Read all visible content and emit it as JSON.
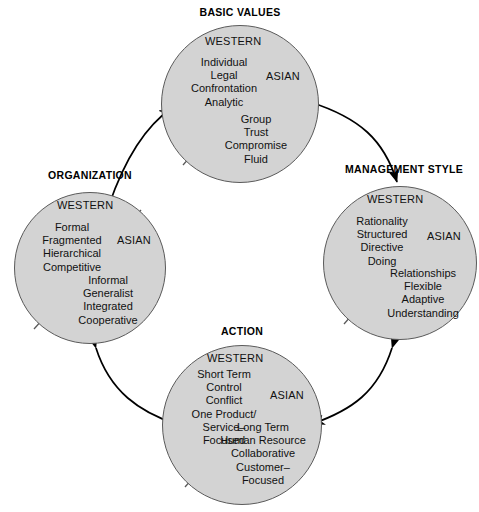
{
  "diagram": {
    "title_hidden": "",
    "palette": {
      "circle_fill": "#d3d3d3",
      "circle_stroke": "#5a5a5a",
      "text": "#111111",
      "arrow": "#000000",
      "background": "#ffffff"
    },
    "column_labels": {
      "western": "WESTERN",
      "asian": "ASIAN"
    },
    "nodes": [
      {
        "id": "basic-values",
        "title": "BASIC VALUES",
        "western": [
          "Individual",
          "Legal",
          "Confrontation",
          "Analytic"
        ],
        "asian": [
          "Group",
          "Trust",
          "Compromise",
          "Fluid"
        ]
      },
      {
        "id": "organization",
        "title": "ORGANIZATION",
        "western": [
          "Formal",
          "Fragmented",
          "Hierarchical",
          "Competitive"
        ],
        "asian": [
          "Informal",
          "Generalist",
          "Integrated",
          "Cooperative"
        ]
      },
      {
        "id": "management-style",
        "title": "MANAGEMENT STYLE",
        "western": [
          "Rationality",
          "Structured",
          "Directive",
          "Doing"
        ],
        "asian": [
          "Relationships",
          "Flexible",
          "Adaptive",
          "Understanding"
        ]
      },
      {
        "id": "action",
        "title": "ACTION",
        "western": [
          "Short Term",
          "Control",
          "Conflict",
          "One Product/",
          "Service–",
          "Focused"
        ],
        "asian": [
          "Long Term",
          "Human Resource",
          "Collaborative",
          "Customer–",
          "Focused"
        ]
      }
    ],
    "connectors": [
      {
        "id": "organization-to-basic-values",
        "style": "double-headed-curved-arrow"
      },
      {
        "id": "basic-values-to-management-style",
        "style": "double-headed-curved-arrow"
      },
      {
        "id": "management-style-to-action",
        "style": "double-headed-curved-arrow"
      },
      {
        "id": "action-to-organization",
        "style": "double-headed-curved-arrow"
      }
    ]
  }
}
